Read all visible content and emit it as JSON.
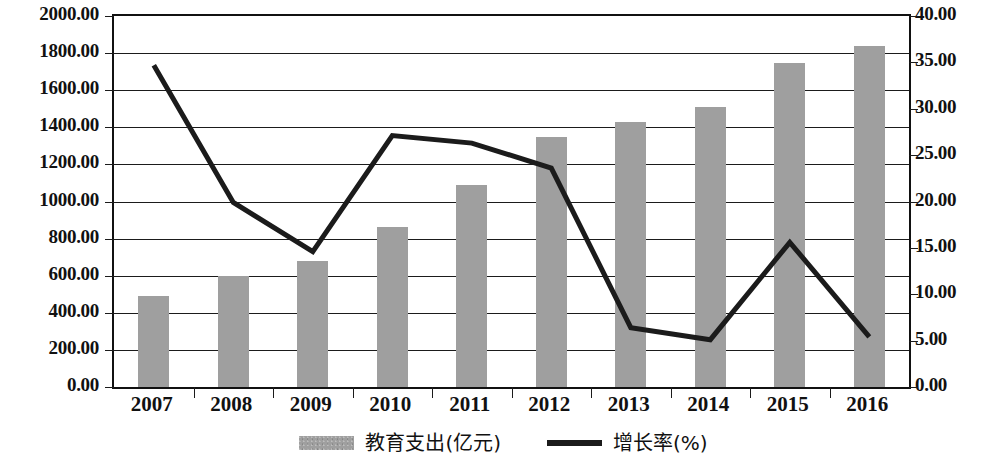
{
  "chart_data": {
    "type": "bar",
    "title": "",
    "subtitle": "",
    "xlabel": "",
    "ylabel": "",
    "y2label": "",
    "grid": true,
    "legend_position": "bottom",
    "categories": [
      "2007",
      "2008",
      "2009",
      "2010",
      "2011",
      "2012",
      "2013",
      "2014",
      "2015",
      "2016"
    ],
    "ylim": [
      0,
      2000
    ],
    "ytick_step": 200,
    "y2lim": [
      0,
      40
    ],
    "y2tick_step": 5,
    "ytick_labels": [
      "0.00",
      "200.00",
      "400.00",
      "600.00",
      "800.00",
      "1000.00",
      "1200.00",
      "1400.00",
      "1600.00",
      "1800.00",
      "2000.00"
    ],
    "y2tick_labels": [
      "0.00",
      "5.00",
      "10.00",
      "15.00",
      "20.00",
      "25.00",
      "30.00",
      "35.00",
      "40.00"
    ],
    "series": [
      {
        "name": "教育支出(亿元)",
        "type": "bar",
        "axis": "left",
        "color": "#9f9f9f",
        "values": [
          490,
          600,
          680,
          865,
          1090,
          1350,
          1430,
          1510,
          1745,
          1840
        ]
      },
      {
        "name": "增长率(%)",
        "type": "line",
        "axis": "right",
        "color": "#1b1b1b",
        "values": [
          34.7,
          19.9,
          14.6,
          27.1,
          26.3,
          23.6,
          6.4,
          5.1,
          15.6,
          5.4
        ]
      }
    ]
  },
  "legend": {
    "items": [
      {
        "label": "教育支出(亿元)",
        "marker": "bar-swatch"
      },
      {
        "label": "增长率(%)",
        "marker": "line-swatch"
      }
    ]
  }
}
